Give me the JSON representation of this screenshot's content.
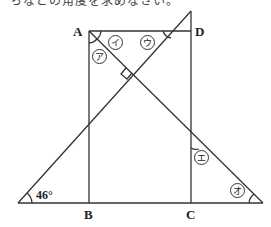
{
  "header": {
    "cut_text": "ちなどの角度を求めなさい。"
  },
  "figure": {
    "points": [
      {
        "name": "A",
        "label": "A"
      },
      {
        "name": "B",
        "label": "B"
      },
      {
        "name": "C",
        "label": "C"
      },
      {
        "name": "D",
        "label": "D"
      }
    ],
    "angles": [
      {
        "id": "a",
        "label": "ア"
      },
      {
        "id": "i",
        "label": "イ"
      },
      {
        "id": "u",
        "label": "ウ"
      },
      {
        "id": "e",
        "label": "エ"
      },
      {
        "id": "o",
        "label": "オ"
      }
    ],
    "given_angle": "46°",
    "colors": {
      "line": "#333333",
      "background": "#ffffff"
    }
  }
}
